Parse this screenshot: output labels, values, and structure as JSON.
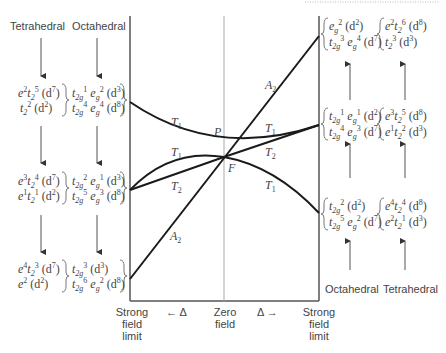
{
  "headers": {
    "left_tetrahedral": "Tetrahedral",
    "left_octahedral": "Octahedral",
    "right_octahedral": "Octahedral",
    "right_tetrahedral": "Tetrahedral"
  },
  "axis_labels": {
    "left": [
      "Strong",
      "field",
      "limit"
    ],
    "center": [
      "Zero",
      "field"
    ],
    "right": [
      "Strong",
      "field",
      "limit"
    ],
    "delta_left": "← Δ",
    "delta_right": "Δ →"
  },
  "curve_labels": {
    "a2_upper": "A",
    "a2_upper_sub": "2",
    "a2_lower": "A",
    "a2_lower_sub": "2",
    "t1_upper_left": "T",
    "t1_upper_left_sub": "1",
    "t1_mid_left": "T",
    "t1_mid_left_sub": "1",
    "t2_left": "T",
    "t2_left_sub": "2",
    "t1_right_upper": "T",
    "t1_right_upper_sub": "1",
    "t2_right": "T",
    "t2_right_sub": "2",
    "t1_right_lower": "T",
    "t1_right_lower_sub": "1",
    "P": "P",
    "F": "F"
  },
  "left_terms": {
    "top": {
      "tet": [
        "e²t₂⁵ (d⁷)",
        "t₂² (d²)"
      ],
      "oct": [
        "t₂g¹ e_g² (d³)",
        "t₂g⁴ e_g⁴ (d⁸)"
      ]
    },
    "middle": {
      "tet": [
        "e³t₂⁴ (d⁷)",
        "e¹t₂¹ (d²)"
      ],
      "oct": [
        "t₂g² e_g¹ (d³)",
        "t₂g⁵ e_g³ (d⁸)"
      ]
    },
    "bottom": {
      "tet": [
        "e⁴t₂³ (d⁷)",
        "e² (d²)"
      ],
      "oct": [
        "t₂g³ (d³)",
        "t₂g⁶ e_g² (d⁸)"
      ]
    }
  },
  "right_terms": {
    "top": {
      "oct": [
        "e_g² (d²)",
        "t₂g³ e_g⁴ (d⁷)"
      ],
      "tet": [
        "e²t₂⁶ (d⁸)",
        "t₂³ (d³)"
      ]
    },
    "middle": {
      "oct": [
        "t₂g¹ e_g¹ (d²)",
        "t₂g⁴ e_g³ (d⁷)"
      ],
      "tet": [
        "e³t₂⁵ (d⁸)",
        "e¹t₂² (d³)"
      ]
    },
    "bottom": {
      "oct": [
        "t₂g² (d²)",
        "t₂g⁵ e_g² (d⁷)"
      ],
      "tet": [
        "e⁴t₂⁴ (d⁸)",
        "e²t₂¹ (d³)"
      ]
    }
  },
  "colors": {
    "curve": "#1a1a1a",
    "axis": "#555555",
    "center_line": "#aaaaaa",
    "text": "#444444"
  }
}
